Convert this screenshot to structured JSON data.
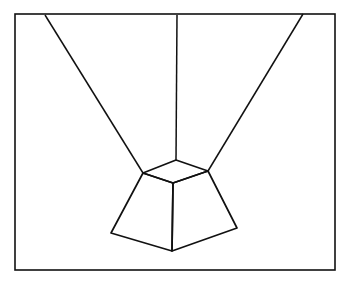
{
  "diagram": {
    "title": "",
    "stroke_color": "#111111",
    "background": "#ffffff",
    "frame": {
      "x": 15,
      "y": 14,
      "width": 320,
      "height": 256
    },
    "lines": [
      {
        "name": "ray-left",
        "x1": 45,
        "y1": 15,
        "x2": 143,
        "y2": 173
      },
      {
        "name": "ray-center",
        "x1": 177,
        "y1": 15,
        "x2": 176,
        "y2": 160
      },
      {
        "name": "ray-right",
        "x1": 303,
        "y1": 14,
        "x2": 208,
        "y2": 171
      }
    ],
    "solid": {
      "top_face": [
        [
          143,
          173
        ],
        [
          176,
          160
        ],
        [
          208,
          171
        ],
        [
          173,
          183
        ]
      ],
      "left_face": [
        [
          143,
          173
        ],
        [
          173,
          183
        ],
        [
          172,
          251
        ],
        [
          111,
          233
        ]
      ],
      "right_face": [
        [
          173,
          183
        ],
        [
          208,
          171
        ],
        [
          237,
          228
        ],
        [
          172,
          251
        ]
      ]
    }
  }
}
